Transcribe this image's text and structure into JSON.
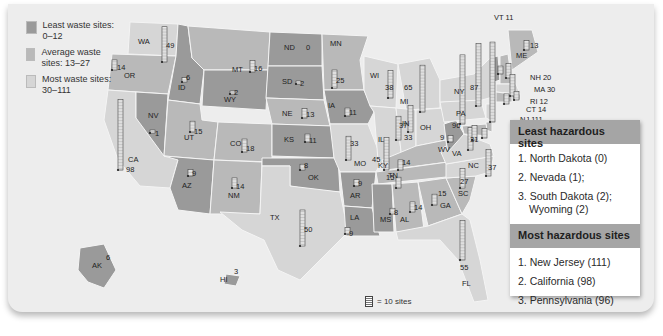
{
  "legend": {
    "items": [
      {
        "label": "Least waste sites: 0–12",
        "color": "#9a9a9a"
      },
      {
        "label": "Average waste sites: 13–27",
        "color": "#b9b9b9"
      },
      {
        "label": "Most waste sites: 30–111",
        "color": "#d6d6d6"
      }
    ]
  },
  "key": {
    "label": "= 10 sites",
    "icon": "bar-segment-icon"
  },
  "least_panel": {
    "title": "Least hazardous sites",
    "items": [
      "1. North Dakota (0)",
      "2. Nevada (1);",
      "3. South Dakota (2);",
      "Wyoming (2)"
    ]
  },
  "most_panel": {
    "title": "Most hazardous sites",
    "items": [
      "1. New Jersey (111)",
      "2. California (98)",
      "3. Pennsylvania (96)"
    ]
  },
  "colors": {
    "least": "#9a9a9a",
    "average": "#b9b9b9",
    "most": "#d6d6d6",
    "border": "#ffffff"
  },
  "map_data": {
    "title": "Hazardous waste sites by state",
    "unit": "sites",
    "bar_scale": "1 segment = 1 site; glyph = 10 sites",
    "states": [
      {
        "abbr": "WA",
        "value": 49
      },
      {
        "abbr": "OR",
        "value": 14
      },
      {
        "abbr": "CA",
        "value": 98
      },
      {
        "abbr": "NV",
        "value": 1
      },
      {
        "abbr": "ID",
        "value": 6
      },
      {
        "abbr": "MT",
        "value": 16
      },
      {
        "abbr": "WY",
        "value": 2
      },
      {
        "abbr": "UT",
        "value": 15
      },
      {
        "abbr": "CO",
        "value": 18
      },
      {
        "abbr": "AZ",
        "value": 9
      },
      {
        "abbr": "NM",
        "value": 14
      },
      {
        "abbr": "ND",
        "value": 0
      },
      {
        "abbr": "SD",
        "value": 2
      },
      {
        "abbr": "NE",
        "value": 13
      },
      {
        "abbr": "KS",
        "value": 11
      },
      {
        "abbr": "OK",
        "value": 8
      },
      {
        "abbr": "TX",
        "value": 50
      },
      {
        "abbr": "MN",
        "value": 25
      },
      {
        "abbr": "IA",
        "value": 11
      },
      {
        "abbr": "MO",
        "value": 33
      },
      {
        "abbr": "AR",
        "value": 9
      },
      {
        "abbr": "LA",
        "value": 9
      },
      {
        "abbr": "WI",
        "value": 38
      },
      {
        "abbr": "IL",
        "value": 45
      },
      {
        "abbr": "MI",
        "value": 65
      },
      {
        "abbr": "IN",
        "value": 33
      },
      {
        "abbr": "OH",
        "value": 37
      },
      {
        "abbr": "KY",
        "value": 14
      },
      {
        "abbr": "TN",
        "value": 15
      },
      {
        "abbr": "MS",
        "value": 8
      },
      {
        "abbr": "AL",
        "value": 14
      },
      {
        "abbr": "GA",
        "value": 15
      },
      {
        "abbr": "FL",
        "value": 55
      },
      {
        "abbr": "SC",
        "value": 27
      },
      {
        "abbr": "NC",
        "value": 37
      },
      {
        "abbr": "VA",
        "value": 31
      },
      {
        "abbr": "WV",
        "value": 9
      },
      {
        "abbr": "PA",
        "value": 96
      },
      {
        "abbr": "NY",
        "value": 87
      },
      {
        "abbr": "VT",
        "value": 11
      },
      {
        "abbr": "NH",
        "value": 20
      },
      {
        "abbr": "ME",
        "value": 13
      },
      {
        "abbr": "MA",
        "value": 30
      },
      {
        "abbr": "RI",
        "value": 12
      },
      {
        "abbr": "CT",
        "value": 14
      },
      {
        "abbr": "NJ",
        "value": 111
      },
      {
        "abbr": "DE",
        "value": 13
      },
      {
        "abbr": "MD",
        "value": 20
      },
      {
        "abbr": "DC",
        "value": 1
      },
      {
        "abbr": "AK",
        "value": 6
      },
      {
        "abbr": "HI",
        "value": 3
      }
    ]
  }
}
